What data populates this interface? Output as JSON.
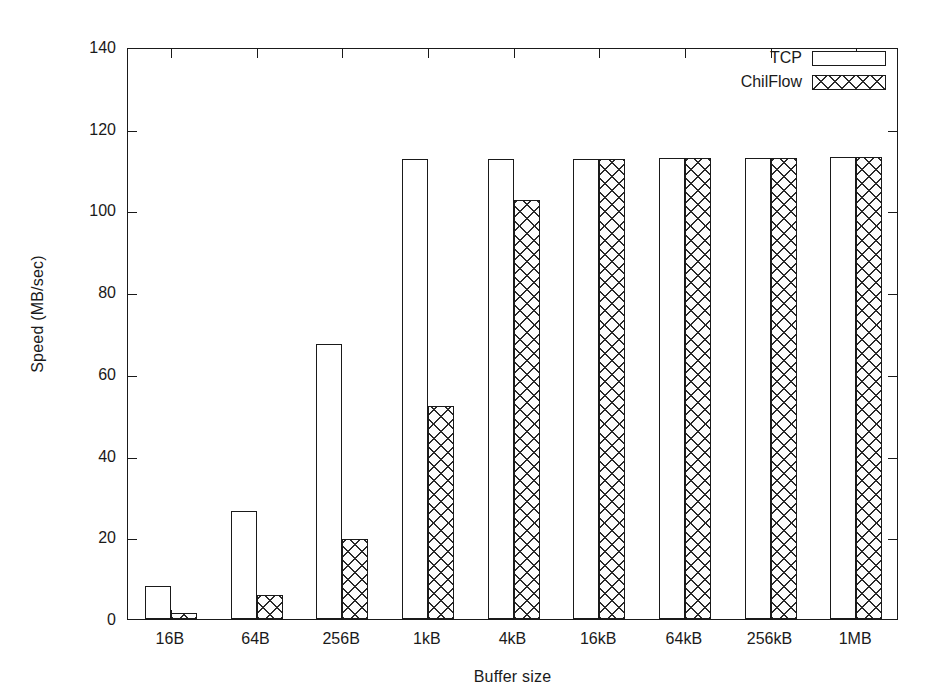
{
  "chart_data": {
    "type": "bar",
    "title": "",
    "xlabel": "Buffer size",
    "ylabel": "Speed (MB/sec)",
    "categories": [
      "16B",
      "64B",
      "256B",
      "1kB",
      "4kB",
      "16kB",
      "64kB",
      "256kB",
      "1MB"
    ],
    "series": [
      {
        "name": "TCP",
        "values": [
          8.2,
          26.4,
          67.3,
          112.6,
          112.6,
          112.7,
          112.9,
          112.9,
          113.0
        ]
      },
      {
        "name": "ChilFlow",
        "values": [
          1.4,
          5.8,
          19.6,
          52.2,
          102.5,
          112.7,
          112.9,
          112.9,
          113.2
        ]
      }
    ],
    "ylim": [
      0,
      140
    ],
    "yticks": [
      0,
      20,
      40,
      60,
      80,
      100,
      120,
      140
    ],
    "ytick_labels": [
      "0",
      "20",
      "40",
      "60",
      "80",
      "100",
      "120",
      "140"
    ],
    "grid": false,
    "legend_position": "top-right",
    "legend_entries": [
      {
        "label": "TCP",
        "pattern": "solid-outline-white"
      },
      {
        "label": "ChilFlow",
        "pattern": "cross-hatch"
      }
    ]
  }
}
